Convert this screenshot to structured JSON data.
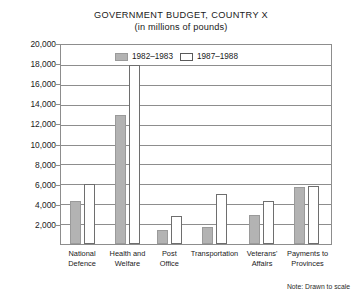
{
  "chart_data": {
    "type": "bar",
    "title": "GOVERNMENT BUDGET, COUNTRY X",
    "subtitle": "(in millions of pounds)",
    "xlabel": "",
    "ylabel": "",
    "ylim": [
      0,
      20000
    ],
    "ytick_step": 2000,
    "grid": true,
    "legend_position": "inside-top-center",
    "note": "Note: Drawn to scale",
    "categories": [
      "National Defence",
      "Health and Welfare",
      "Post Office",
      "Transportation",
      "Veterans' Affairs",
      "Payments to Provinces"
    ],
    "category_lines": [
      [
        "National",
        "Defence"
      ],
      [
        "Health and",
        "Welfare"
      ],
      [
        "Post",
        "Office"
      ],
      [
        "Transportation"
      ],
      [
        "Veterans'",
        "Affairs"
      ],
      [
        "Payments to",
        "Provinces"
      ]
    ],
    "ticks": [
      "20,000",
      "18,000",
      "16,000",
      "14,000",
      "12,000",
      "10,000",
      "8,000",
      "6,000",
      "4,000",
      "2,000"
    ],
    "tick_values": [
      20000,
      18000,
      16000,
      14000,
      12000,
      10000,
      8000,
      6000,
      4000,
      2000
    ],
    "series": [
      {
        "name": "1982-1983",
        "color": "#b3b3b3",
        "values": [
          4300,
          13000,
          1400,
          1700,
          2900,
          5700
        ]
      },
      {
        "name": "1987-1988",
        "color": "#ffffff",
        "values": [
          6000,
          18000,
          2800,
          5000,
          4300,
          5800
        ]
      }
    ]
  },
  "legend": {
    "items": [
      {
        "label": "1982–1983",
        "swatch": "filled-gray-swatch"
      },
      {
        "label": "1987–1988",
        "swatch": "outlined-white-swatch"
      }
    ]
  }
}
